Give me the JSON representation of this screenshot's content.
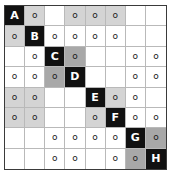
{
  "puzzle": {
    "type": "logic-grid-puzzle",
    "rows": 8,
    "columns": 8,
    "colors": {
      "black_cell": "#111111",
      "light_gray_cell": "#d4d4d4",
      "mid_gray_cell": "#a8a8a8",
      "white_cell": "#ffffff",
      "grid_line": "#b9b9b9",
      "outer_border": "#3a3a3a",
      "letter_text": "#ffffff",
      "mark_text": "#1a1a1a"
    },
    "diagonal_labels": [
      "A",
      "B",
      "C",
      "D",
      "E",
      "F",
      "G",
      "H"
    ],
    "mark_glyph": "o",
    "cells": [
      [
        {
          "text": "A",
          "shade": "black"
        },
        {
          "text": "o",
          "shade": "light"
        },
        {
          "text": "",
          "shade": "white"
        },
        {
          "text": "o",
          "shade": "light"
        },
        {
          "text": "o",
          "shade": "light"
        },
        {
          "text": "o",
          "shade": "light"
        },
        {
          "text": "",
          "shade": "white"
        },
        {
          "text": "",
          "shade": "white"
        }
      ],
      [
        {
          "text": "o",
          "shade": "light"
        },
        {
          "text": "B",
          "shade": "black"
        },
        {
          "text": "o",
          "shade": "white"
        },
        {
          "text": "o",
          "shade": "white"
        },
        {
          "text": "o",
          "shade": "white"
        },
        {
          "text": "o",
          "shade": "white"
        },
        {
          "text": "",
          "shade": "white"
        },
        {
          "text": "",
          "shade": "white"
        }
      ],
      [
        {
          "text": "",
          "shade": "white"
        },
        {
          "text": "o",
          "shade": "white"
        },
        {
          "text": "C",
          "shade": "black"
        },
        {
          "text": "o",
          "shade": "mid"
        },
        {
          "text": "",
          "shade": "white"
        },
        {
          "text": "",
          "shade": "white"
        },
        {
          "text": "o",
          "shade": "white"
        },
        {
          "text": "o",
          "shade": "white"
        }
      ],
      [
        {
          "text": "o",
          "shade": "white"
        },
        {
          "text": "o",
          "shade": "white"
        },
        {
          "text": "o",
          "shade": "mid"
        },
        {
          "text": "D",
          "shade": "black"
        },
        {
          "text": "",
          "shade": "white"
        },
        {
          "text": "",
          "shade": "white"
        },
        {
          "text": "o",
          "shade": "white"
        },
        {
          "text": "o",
          "shade": "white"
        }
      ],
      [
        {
          "text": "o",
          "shade": "light"
        },
        {
          "text": "o",
          "shade": "light"
        },
        {
          "text": "",
          "shade": "white"
        },
        {
          "text": "",
          "shade": "white"
        },
        {
          "text": "E",
          "shade": "black"
        },
        {
          "text": "o",
          "shade": "light"
        },
        {
          "text": "o",
          "shade": "white"
        },
        {
          "text": "",
          "shade": "white"
        }
      ],
      [
        {
          "text": "o",
          "shade": "light"
        },
        {
          "text": "o",
          "shade": "light"
        },
        {
          "text": "",
          "shade": "white"
        },
        {
          "text": "",
          "shade": "white"
        },
        {
          "text": "o",
          "shade": "light"
        },
        {
          "text": "F",
          "shade": "black"
        },
        {
          "text": "o",
          "shade": "white"
        },
        {
          "text": "o",
          "shade": "white"
        }
      ],
      [
        {
          "text": "",
          "shade": "white"
        },
        {
          "text": "",
          "shade": "white"
        },
        {
          "text": "o",
          "shade": "white"
        },
        {
          "text": "o",
          "shade": "white"
        },
        {
          "text": "o",
          "shade": "white"
        },
        {
          "text": "o",
          "shade": "white"
        },
        {
          "text": "G",
          "shade": "black"
        },
        {
          "text": "o",
          "shade": "mid"
        }
      ],
      [
        {
          "text": "",
          "shade": "white"
        },
        {
          "text": "",
          "shade": "white"
        },
        {
          "text": "o",
          "shade": "white"
        },
        {
          "text": "o",
          "shade": "white"
        },
        {
          "text": "",
          "shade": "white"
        },
        {
          "text": "o",
          "shade": "white"
        },
        {
          "text": "o",
          "shade": "mid"
        },
        {
          "text": "H",
          "shade": "black"
        }
      ]
    ]
  }
}
